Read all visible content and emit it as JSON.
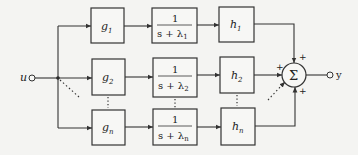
{
  "diagram": {
    "input": {
      "label": "u"
    },
    "output": {
      "label": "y"
    },
    "branches": [
      {
        "gain_in": "g",
        "gain_in_sub": "1",
        "filter_num": "1",
        "filter_den": "s + λ",
        "filter_sub": "1",
        "gain_out": "h",
        "gain_out_sub": "1",
        "sum_sign": "+"
      },
      {
        "gain_in": "g",
        "gain_in_sub": "2",
        "filter_num": "1",
        "filter_den": "s + λ",
        "filter_sub": "2",
        "gain_out": "h",
        "gain_out_sub": "2",
        "sum_sign": "+"
      },
      {
        "gain_in": "g",
        "gain_in_sub": "n",
        "filter_num": "1",
        "filter_den": "s + λ",
        "filter_sub": "n",
        "gain_out": "h",
        "gain_out_sub": "n",
        "sum_sign": "+"
      }
    ],
    "summer": {
      "symbol": "Σ",
      "extra_sign": "+"
    },
    "ellipsis": "⋮"
  }
}
